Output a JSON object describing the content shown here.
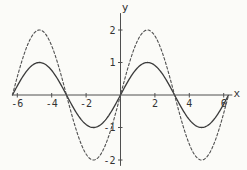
{
  "chart_data": {
    "type": "line",
    "title": "",
    "xlabel": "x",
    "ylabel": "y",
    "x_range": [
      -6.2832,
      6.2832
    ],
    "xlim": [
      -6.25,
      6.5
    ],
    "ylim": [
      -2.18,
      2.52
    ],
    "grid": false,
    "legend": null,
    "x_ticks": {
      "values": [
        -6,
        -4,
        -2,
        2,
        4,
        6
      ],
      "labels": [
        "-6",
        "-4",
        "-2",
        "2",
        "4",
        "6"
      ]
    },
    "y_ticks": {
      "values": [
        -2,
        -1,
        1,
        2
      ],
      "labels": [
        "-2",
        "-1",
        "1",
        "2"
      ]
    },
    "series": [
      {
        "name": "sin(x)",
        "function": "y = sin(x)",
        "amplitude": 1,
        "period": 6.2832,
        "phase": 0,
        "style": "solid",
        "color": "#3b3b3b",
        "key_points": {
          "zeros": [
            -6.2832,
            -3.1416,
            0,
            3.1416,
            6.2832
          ],
          "maxima": [
            [
              -4.7124,
              1
            ],
            [
              1.5708,
              1
            ]
          ],
          "minima": [
            [
              -1.5708,
              -1
            ],
            [
              4.7124,
              -1
            ]
          ]
        }
      },
      {
        "name": "2 sin(x)",
        "function": "y = 2 sin(x)",
        "amplitude": 2,
        "period": 6.2832,
        "phase": 0,
        "style": "dashed",
        "color": "#4f4f4f",
        "key_points": {
          "zeros": [
            -6.2832,
            -3.1416,
            0,
            3.1416,
            6.2832
          ],
          "maxima": [
            [
              -4.7124,
              2
            ],
            [
              1.5708,
              2
            ]
          ],
          "minima": [
            [
              -1.5708,
              -2
            ],
            [
              4.7124,
              -2
            ]
          ]
        }
      }
    ],
    "axis_color": "#4f4f4f",
    "tick_label_color": "#333333",
    "background": "#fbfbf8"
  }
}
